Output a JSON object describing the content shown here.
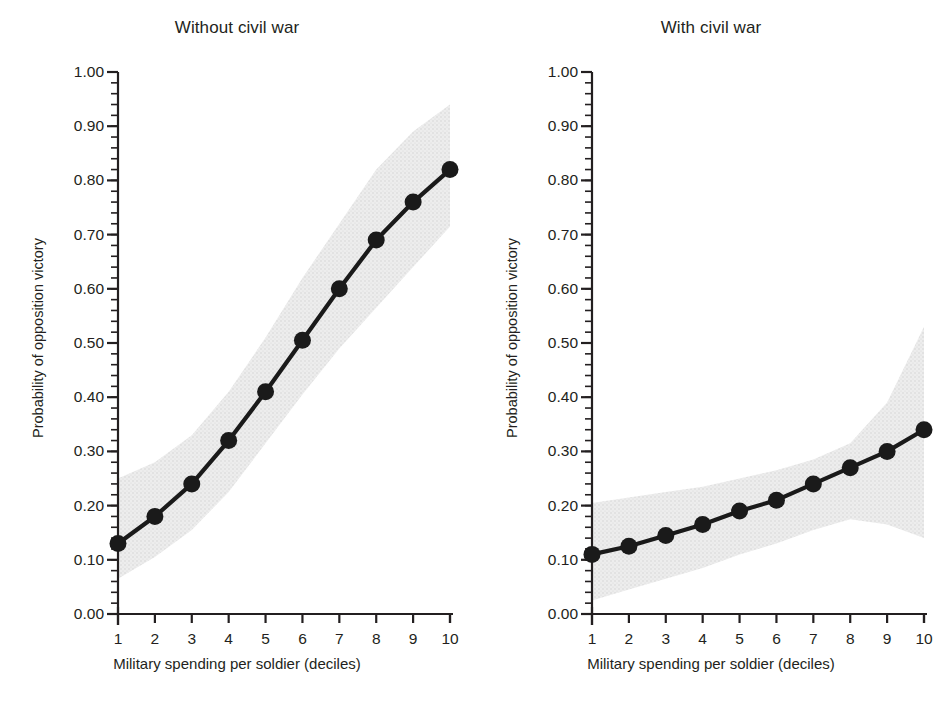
{
  "figure": {
    "background": "#ffffff",
    "line_color": "#1a1a1a",
    "marker_color": "#1a1a1a",
    "band_color": "#e4e4e4",
    "axis_color": "#231f20",
    "text_color": "#231f20"
  },
  "chart_data": [
    {
      "type": "line",
      "title": "Without civil war",
      "xlabel": "Military spending per soldier (deciles)",
      "ylabel": "Probability of opposition victory",
      "x": [
        1,
        2,
        3,
        4,
        5,
        6,
        7,
        8,
        9,
        10
      ],
      "categories": [
        "1",
        "2",
        "3",
        "4",
        "5",
        "6",
        "7",
        "8",
        "9",
        "10"
      ],
      "values": [
        0.13,
        0.18,
        0.24,
        0.32,
        0.41,
        0.505,
        0.6,
        0.69,
        0.76,
        0.82
      ],
      "ci_upper": [
        0.25,
        0.28,
        0.33,
        0.41,
        0.51,
        0.62,
        0.72,
        0.82,
        0.89,
        0.94
      ],
      "ci_lower": [
        0.065,
        0.105,
        0.155,
        0.225,
        0.315,
        0.405,
        0.49,
        0.565,
        0.64,
        0.715
      ],
      "xlim": [
        1,
        10
      ],
      "ylim": [
        0.0,
        1.0
      ],
      "ytick_labels": [
        "1.00",
        "0.90",
        "0.80",
        "0.70",
        "0.60",
        "0.50",
        "0.40",
        "0.30",
        "0.20",
        "0.10",
        "0.00"
      ],
      "ytick_values": [
        1.0,
        0.9,
        0.8,
        0.7,
        0.6,
        0.5,
        0.4,
        0.3,
        0.2,
        0.1,
        0.0
      ],
      "yminor_step": 0.02,
      "grid": false,
      "legend": "none",
      "band_label": "confidence interval"
    },
    {
      "type": "line",
      "title": "With civil war",
      "xlabel": "Military spending per soldier (deciles)",
      "ylabel": "Probability of opposition victory",
      "x": [
        1,
        2,
        3,
        4,
        5,
        6,
        7,
        8,
        9,
        10
      ],
      "categories": [
        "1",
        "2",
        "3",
        "4",
        "5",
        "6",
        "7",
        "8",
        "9",
        "10"
      ],
      "values": [
        0.11,
        0.125,
        0.145,
        0.165,
        0.19,
        0.21,
        0.24,
        0.27,
        0.3,
        0.34
      ],
      "ci_upper": [
        0.205,
        0.215,
        0.225,
        0.235,
        0.25,
        0.265,
        0.285,
        0.315,
        0.39,
        0.53
      ],
      "ci_lower": [
        0.025,
        0.045,
        0.065,
        0.085,
        0.11,
        0.13,
        0.155,
        0.175,
        0.165,
        0.14
      ],
      "xlim": [
        1,
        10
      ],
      "ylim": [
        0.0,
        1.0
      ],
      "ytick_labels": [
        "1.00",
        "0.90",
        "0.80",
        "0.70",
        "0.60",
        "0.50",
        "0.40",
        "0.30",
        "0.20",
        "0.10",
        "0.00"
      ],
      "ytick_values": [
        1.0,
        0.9,
        0.8,
        0.7,
        0.6,
        0.5,
        0.4,
        0.3,
        0.2,
        0.1,
        0.0
      ],
      "yminor_step": 0.02,
      "grid": false,
      "legend": "none",
      "band_label": "confidence interval"
    }
  ],
  "panels": [
    {
      "title": "Without civil war",
      "xlabel": "Military spending per soldier (deciles)",
      "ylabel": "Probability of opposition victory"
    },
    {
      "title": "With civil war",
      "xlabel": "Military spending per soldier (deciles)",
      "ylabel": "Probability of opposition victory"
    }
  ]
}
